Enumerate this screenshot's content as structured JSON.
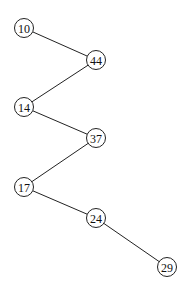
{
  "diagram": {
    "type": "binary-tree",
    "nodes": [
      {
        "id": "n10",
        "label": "10",
        "x": 24,
        "y": 28
      },
      {
        "id": "n44",
        "label": "44",
        "x": 96,
        "y": 60
      },
      {
        "id": "n14",
        "label": "14",
        "x": 24,
        "y": 107
      },
      {
        "id": "n37",
        "label": "37",
        "x": 96,
        "y": 138
      },
      {
        "id": "n17",
        "label": "17",
        "x": 24,
        "y": 187
      },
      {
        "id": "n24",
        "label": "24",
        "x": 96,
        "y": 218
      },
      {
        "id": "n29",
        "label": "29",
        "x": 167,
        "y": 267
      }
    ],
    "edges": [
      {
        "from": "n10",
        "to": "n44"
      },
      {
        "from": "n44",
        "to": "n14"
      },
      {
        "from": "n14",
        "to": "n37"
      },
      {
        "from": "n37",
        "to": "n17"
      },
      {
        "from": "n17",
        "to": "n24"
      },
      {
        "from": "n24",
        "to": "n29"
      }
    ]
  }
}
